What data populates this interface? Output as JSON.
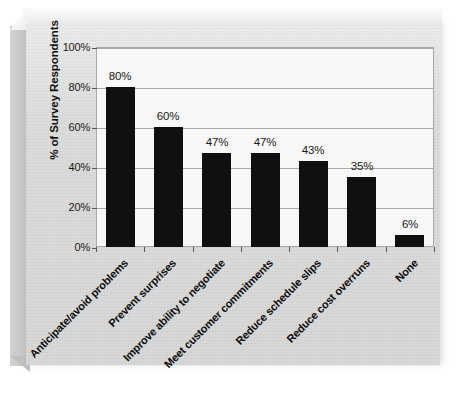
{
  "chart_data": {
    "type": "bar",
    "title": "",
    "subtitle": "",
    "xlabel": "",
    "ylabel": "% of Survey Respondents",
    "ylim": [
      0,
      100
    ],
    "grid": true,
    "legend": "none",
    "orientation": "vertical",
    "bar_color": "#101010",
    "plot_background": "#f7f7f7",
    "panel_background": "#dcdcdc",
    "categories": [
      "Anticipate/avoid problems",
      "Prevent surprises",
      "Improve ability to negotiate",
      "Meet customer commitments",
      "Reduce schedule slips",
      "Reduce cost overruns",
      "None"
    ],
    "values": [
      80,
      60,
      47,
      47,
      43,
      35,
      6
    ],
    "value_labels": [
      "80%",
      "60%",
      "47%",
      "47%",
      "43%",
      "35%",
      "6%"
    ],
    "ytick_values": [
      0,
      20,
      40,
      60,
      80,
      100
    ],
    "ytick_labels": [
      "0%",
      "20%",
      "40%",
      "60%",
      "80%",
      "100%"
    ]
  }
}
